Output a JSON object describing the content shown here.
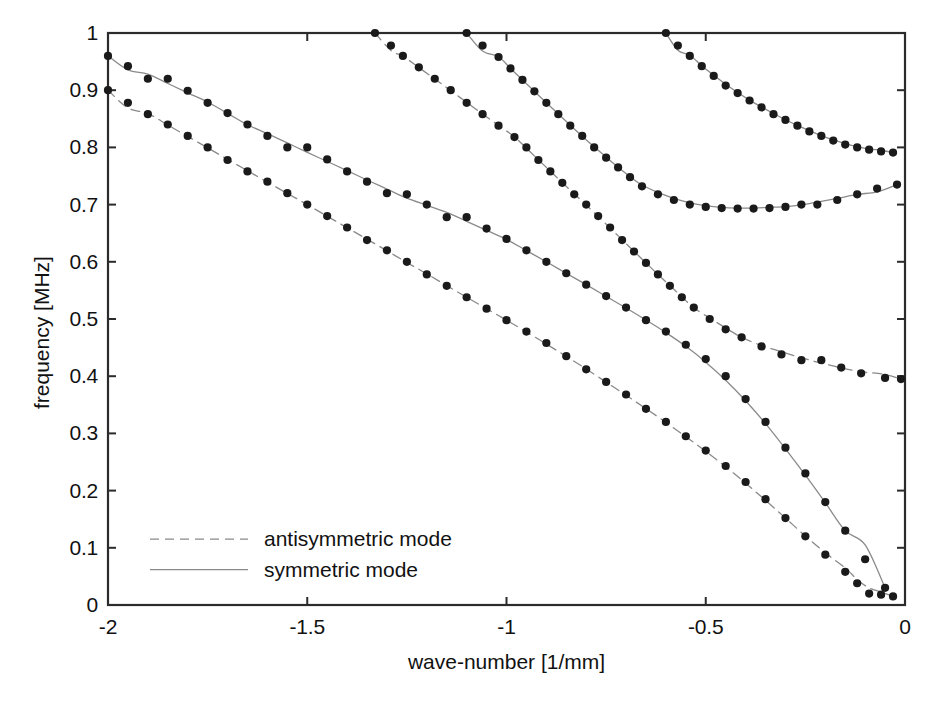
{
  "chart_data": {
    "type": "scatter",
    "title": "",
    "xlabel": "wave-number [1/mm]",
    "ylabel": "frequency [MHz]",
    "xlim": [
      -2,
      0
    ],
    "ylim": [
      0,
      1
    ],
    "xticks": [
      -2,
      -1.5,
      -1,
      -0.5,
      0
    ],
    "xtick_labels": [
      "-2",
      "-1.5",
      "-1",
      "-0.5",
      "0"
    ],
    "yticks": [
      0,
      0.1,
      0.2,
      0.3,
      0.4,
      0.5,
      0.6,
      0.7,
      0.8,
      0.9,
      1
    ],
    "ytick_labels": [
      "0",
      "0.1",
      "0.2",
      "0.3",
      "0.4",
      "0.5",
      "0.6",
      "0.7",
      "0.8",
      "0.9",
      "1"
    ],
    "grid": false,
    "legend_position": "lower left",
    "legend": [
      {
        "label": "antisymmetric mode",
        "style": "dashed"
      },
      {
        "label": "symmetric mode",
        "style": "solid"
      }
    ],
    "series": [
      {
        "name": "symmetric mode branch 1",
        "style": "solid",
        "markers": true,
        "points": [
          [
            -2.0,
            0.96
          ],
          [
            -1.95,
            0.942
          ],
          [
            -1.9,
            0.92
          ],
          [
            -1.85,
            0.92
          ],
          [
            -1.8,
            0.899
          ],
          [
            -1.75,
            0.878
          ],
          [
            -1.7,
            0.86
          ],
          [
            -1.65,
            0.84
          ],
          [
            -1.6,
            0.82
          ],
          [
            -1.55,
            0.8
          ],
          [
            -1.5,
            0.8
          ],
          [
            -1.45,
            0.779
          ],
          [
            -1.4,
            0.758
          ],
          [
            -1.35,
            0.74
          ],
          [
            -1.3,
            0.72
          ],
          [
            -1.25,
            0.718
          ],
          [
            -1.2,
            0.7
          ],
          [
            -1.15,
            0.678
          ],
          [
            -1.1,
            0.678
          ],
          [
            -1.05,
            0.658
          ],
          [
            -1.0,
            0.64
          ],
          [
            -0.95,
            0.62
          ],
          [
            -0.9,
            0.6
          ],
          [
            -0.85,
            0.58
          ],
          [
            -0.8,
            0.56
          ],
          [
            -0.75,
            0.54
          ],
          [
            -0.7,
            0.52
          ],
          [
            -0.65,
            0.498
          ],
          [
            -0.6,
            0.478
          ],
          [
            -0.55,
            0.455
          ],
          [
            -0.5,
            0.43
          ],
          [
            -0.45,
            0.4
          ],
          [
            -0.4,
            0.36
          ],
          [
            -0.35,
            0.32
          ],
          [
            -0.3,
            0.275
          ],
          [
            -0.25,
            0.23
          ],
          [
            -0.2,
            0.18
          ],
          [
            -0.15,
            0.13
          ],
          [
            -0.1,
            0.08
          ],
          [
            -0.05,
            0.03
          ]
        ]
      },
      {
        "name": "antisymmetric mode branch 1",
        "style": "dashed",
        "markers": true,
        "points": [
          [
            -2.0,
            0.9
          ],
          [
            -1.95,
            0.878
          ],
          [
            -1.9,
            0.858
          ],
          [
            -1.85,
            0.84
          ],
          [
            -1.8,
            0.82
          ],
          [
            -1.75,
            0.8
          ],
          [
            -1.7,
            0.778
          ],
          [
            -1.65,
            0.758
          ],
          [
            -1.6,
            0.74
          ],
          [
            -1.55,
            0.72
          ],
          [
            -1.5,
            0.7
          ],
          [
            -1.45,
            0.68
          ],
          [
            -1.4,
            0.66
          ],
          [
            -1.35,
            0.638
          ],
          [
            -1.3,
            0.62
          ],
          [
            -1.25,
            0.6
          ],
          [
            -1.2,
            0.578
          ],
          [
            -1.15,
            0.558
          ],
          [
            -1.1,
            0.538
          ],
          [
            -1.05,
            0.518
          ],
          [
            -1.0,
            0.498
          ],
          [
            -0.95,
            0.478
          ],
          [
            -0.9,
            0.458
          ],
          [
            -0.85,
            0.435
          ],
          [
            -0.8,
            0.412
          ],
          [
            -0.75,
            0.39
          ],
          [
            -0.7,
            0.368
          ],
          [
            -0.65,
            0.343
          ],
          [
            -0.6,
            0.32
          ],
          [
            -0.55,
            0.295
          ],
          [
            -0.5,
            0.27
          ],
          [
            -0.45,
            0.243
          ],
          [
            -0.4,
            0.215
          ],
          [
            -0.35,
            0.185
          ],
          [
            -0.3,
            0.152
          ],
          [
            -0.25,
            0.12
          ],
          [
            -0.2,
            0.088
          ],
          [
            -0.15,
            0.058
          ],
          [
            -0.12,
            0.038
          ],
          [
            -0.09,
            0.02
          ],
          [
            -0.06,
            0.018
          ],
          [
            -0.03,
            0.015
          ]
        ]
      },
      {
        "name": "antisymmetric mode branch 2",
        "style": "dashed",
        "markers": true,
        "points": [
          [
            -1.33,
            1.0
          ],
          [
            -1.29,
            0.978
          ],
          [
            -1.26,
            0.96
          ],
          [
            -1.22,
            0.94
          ],
          [
            -1.18,
            0.92
          ],
          [
            -1.14,
            0.9
          ],
          [
            -1.1,
            0.878
          ],
          [
            -1.06,
            0.858
          ],
          [
            -1.02,
            0.838
          ],
          [
            -0.98,
            0.818
          ],
          [
            -0.95,
            0.8
          ],
          [
            -0.92,
            0.778
          ],
          [
            -0.89,
            0.758
          ],
          [
            -0.86,
            0.738
          ],
          [
            -0.83,
            0.718
          ],
          [
            -0.8,
            0.7
          ],
          [
            -0.77,
            0.68
          ],
          [
            -0.74,
            0.66
          ],
          [
            -0.71,
            0.638
          ],
          [
            -0.68,
            0.618
          ],
          [
            -0.65,
            0.598
          ],
          [
            -0.62,
            0.578
          ],
          [
            -0.59,
            0.558
          ],
          [
            -0.56,
            0.538
          ],
          [
            -0.53,
            0.52
          ],
          [
            -0.49,
            0.5
          ],
          [
            -0.45,
            0.482
          ],
          [
            -0.41,
            0.468
          ],
          [
            -0.36,
            0.452
          ],
          [
            -0.31,
            0.438
          ],
          [
            -0.26,
            0.428
          ],
          [
            -0.21,
            0.428
          ],
          [
            -0.16,
            0.415
          ],
          [
            -0.11,
            0.405
          ],
          [
            -0.05,
            0.397
          ],
          [
            -0.01,
            0.395
          ]
        ]
      },
      {
        "name": "symmetric mode branch 2",
        "style": "solid",
        "markers": true,
        "points": [
          [
            -1.1,
            1.0
          ],
          [
            -1.06,
            0.978
          ],
          [
            -1.02,
            0.958
          ],
          [
            -0.99,
            0.938
          ],
          [
            -0.96,
            0.918
          ],
          [
            -0.93,
            0.898
          ],
          [
            -0.9,
            0.878
          ],
          [
            -0.87,
            0.858
          ],
          [
            -0.84,
            0.838
          ],
          [
            -0.81,
            0.82
          ],
          [
            -0.78,
            0.8
          ],
          [
            -0.75,
            0.782
          ],
          [
            -0.72,
            0.765
          ],
          [
            -0.69,
            0.748
          ],
          [
            -0.66,
            0.732
          ],
          [
            -0.62,
            0.718
          ],
          [
            -0.58,
            0.708
          ],
          [
            -0.54,
            0.7
          ],
          [
            -0.5,
            0.696
          ],
          [
            -0.46,
            0.694
          ],
          [
            -0.42,
            0.693
          ],
          [
            -0.38,
            0.693
          ],
          [
            -0.34,
            0.694
          ],
          [
            -0.3,
            0.696
          ],
          [
            -0.26,
            0.7
          ],
          [
            -0.22,
            0.7
          ],
          [
            -0.17,
            0.708
          ],
          [
            -0.12,
            0.718
          ],
          [
            -0.07,
            0.728
          ],
          [
            -0.02,
            0.735
          ]
        ]
      },
      {
        "name": "symmetric mode branch 3",
        "style": "solid",
        "markers": true,
        "points": [
          [
            -0.6,
            1.0
          ],
          [
            -0.57,
            0.978
          ],
          [
            -0.54,
            0.96
          ],
          [
            -0.51,
            0.942
          ],
          [
            -0.48,
            0.925
          ],
          [
            -0.45,
            0.908
          ],
          [
            -0.42,
            0.895
          ],
          [
            -0.39,
            0.882
          ],
          [
            -0.36,
            0.87
          ],
          [
            -0.33,
            0.858
          ],
          [
            -0.3,
            0.848
          ],
          [
            -0.27,
            0.838
          ],
          [
            -0.24,
            0.828
          ],
          [
            -0.21,
            0.82
          ],
          [
            -0.18,
            0.812
          ],
          [
            -0.15,
            0.805
          ],
          [
            -0.12,
            0.8
          ],
          [
            -0.09,
            0.796
          ],
          [
            -0.06,
            0.793
          ],
          [
            -0.03,
            0.791
          ]
        ]
      }
    ]
  },
  "axes": {
    "ylabel": "frequency [MHz]",
    "xlabel": "wave-number [1/mm]"
  },
  "legend": {
    "entries": [
      {
        "label": "antisymmetric mode"
      },
      {
        "label": "symmetric mode"
      }
    ]
  },
  "colors": {
    "axis": "#2b2b2b",
    "marker": "#1a1a1a",
    "line": "#8a8a8a",
    "background": "#ffffff"
  }
}
